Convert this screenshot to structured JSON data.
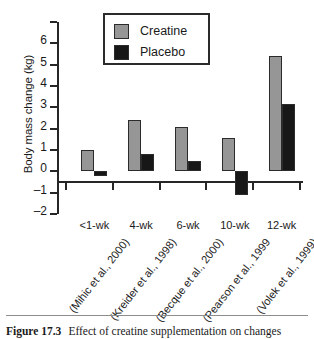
{
  "chart_data": {
    "type": "bar",
    "title": "",
    "xlabel": "",
    "ylabel": "Body mass change (kg)",
    "ylim": [
      -2,
      7
    ],
    "yticks": [
      7,
      6,
      5,
      4,
      3,
      2,
      1,
      0,
      -1,
      -2
    ],
    "ytick_labels": [
      "",
      "6",
      "5",
      "4",
      "3",
      "2",
      "1",
      "0",
      "–1",
      "–2"
    ],
    "grid": false,
    "legend_position": "top-center",
    "categories": [
      "<1-wk",
      "4-wk",
      "6-wk",
      "10-wk",
      "12-wk"
    ],
    "category_citations": [
      "(Mihic et al., 2000)",
      "(Kreider et al., 1998)",
      "(Becque et al., 2000)",
      "(Pearson et al., 1999",
      "(Volek et al., 1999)"
    ],
    "series": [
      {
        "name": "Creatine",
        "color": "#969696",
        "values": [
          1.0,
          2.4,
          2.1,
          1.55,
          5.4
        ]
      },
      {
        "name": "Placebo",
        "color": "#171717",
        "values": [
          -0.2,
          0.8,
          0.5,
          -1.1,
          3.15
        ]
      }
    ]
  },
  "legend": {
    "items": [
      {
        "label": "Creatine",
        "swatch": "gray-square-swatch"
      },
      {
        "label": "Placebo",
        "swatch": "black-square-swatch"
      }
    ]
  },
  "caption": {
    "number": "Figure 17.3",
    "text": "Effect of creatine supplementation on changes"
  }
}
